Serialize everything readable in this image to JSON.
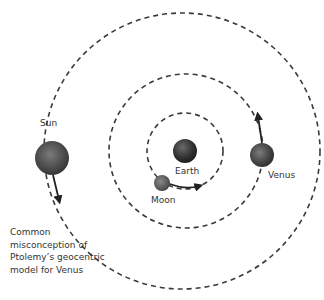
{
  "diagram": {
    "colors": {
      "orbit": "#3a3a3a",
      "arrow": "#222222",
      "text": "#333333",
      "background": "#ffffff"
    },
    "orbits": [
      {
        "name": "moon-orbit",
        "cx": 185,
        "cy": 151,
        "r": 38
      },
      {
        "name": "venus-orbit",
        "cx": 186,
        "cy": 151,
        "r": 77
      },
      {
        "name": "sun-orbit",
        "cx": 182,
        "cy": 151,
        "r": 138
      }
    ],
    "bodies": [
      {
        "name": "Earth",
        "label": "Earth",
        "cx": 185,
        "cy": 151,
        "r": 12
      },
      {
        "name": "Moon",
        "label": "Moon",
        "cx": 162,
        "cy": 183,
        "r": 8
      },
      {
        "name": "Venus",
        "label": "Venus",
        "cx": 262,
        "cy": 155,
        "r": 12
      },
      {
        "name": "Sun",
        "label": "Sun",
        "cx": 52,
        "cy": 158,
        "r": 17
      }
    ],
    "labels": {
      "sun": "Sun",
      "earth": "Earth",
      "moon": "Moon",
      "venus": "Venus"
    },
    "caption": {
      "line1": "Common",
      "line2": "misconception of",
      "line3": "Ptolemy’s geocentric",
      "line4": "model for Venus"
    }
  }
}
